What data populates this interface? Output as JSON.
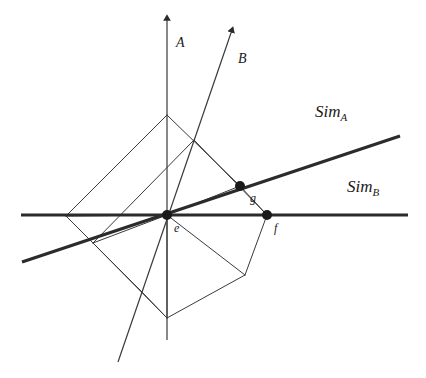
{
  "figure": {
    "type": "geometric-diagram",
    "title": "",
    "background_color": "#ffffff",
    "stroke_color": "#2b2b2b",
    "thin_stroke_width": 1,
    "thick_stroke_width": 3.2,
    "width": 426,
    "height": 378
  },
  "axes": [
    {
      "id": "axis-a",
      "label": "A",
      "label_x": 176,
      "label_y": 36,
      "arrow": true,
      "from": {
        "x": 167,
        "y": 340
      },
      "to": {
        "x": 167,
        "y": 18
      }
    },
    {
      "id": "axis-b",
      "label": "B",
      "label_x": 238,
      "label_y": 52,
      "arrow": true,
      "from": {
        "x": 118,
        "y": 362
      },
      "to": {
        "x": 232,
        "y": 30
      }
    }
  ],
  "sim_lines": [
    {
      "id": "sim-a",
      "label": "Sim",
      "subscript": "A",
      "label_x": 315,
      "label_y": 103,
      "from": {
        "x": 22,
        "y": 262
      },
      "to": {
        "x": 400,
        "y": 136
      }
    },
    {
      "id": "sim-b",
      "label": "Sim",
      "subscript": "B",
      "label_x": 347,
      "label_y": 178,
      "from": {
        "x": 21,
        "y": 215
      },
      "to": {
        "x": 408,
        "y": 215
      }
    }
  ],
  "points": [
    {
      "id": "point-e",
      "label": "e",
      "x": 167,
      "y": 215,
      "label_x": 174,
      "label_y": 222,
      "radius": 5
    },
    {
      "id": "point-g",
      "label": "g",
      "x": 240,
      "y": 186,
      "label_x": 250,
      "label_y": 192,
      "radius": 5
    },
    {
      "id": "point-f",
      "label": "f",
      "x": 267,
      "y": 215,
      "label_x": 274,
      "label_y": 222,
      "radius": 5
    }
  ],
  "lattice": {
    "description": "two overlapping parallelograms forming a lattice around point e",
    "vertices": {
      "left": {
        "x": 66,
        "y": 216
      },
      "top": {
        "x": 167,
        "y": 115
      },
      "center": {
        "x": 167,
        "y": 215
      },
      "bottom": {
        "x": 167,
        "y": 318
      },
      "inner_upper_right": {
        "x": 194,
        "y": 140
      },
      "inner_lower_left": {
        "x": 141,
        "y": 291
      },
      "right_g": {
        "x": 240,
        "y": 186
      },
      "right_f": {
        "x": 267,
        "y": 215
      },
      "lower_left_edge": {
        "x": 93,
        "y": 243
      },
      "lower_right": {
        "x": 245,
        "y": 275
      }
    },
    "edges": [
      {
        "from": [
          66,
          216
        ],
        "to": [
          167,
          115
        ]
      },
      {
        "from": [
          167,
          115
        ],
        "to": [
          240,
          186
        ]
      },
      {
        "from": [
          240,
          186
        ],
        "to": [
          167,
          215
        ]
      },
      {
        "from": [
          167,
          215
        ],
        "to": [
          66,
          216
        ]
      },
      {
        "from": [
          93,
          243
        ],
        "to": [
          194,
          140
        ]
      },
      {
        "from": [
          194,
          140
        ],
        "to": [
          267,
          215
        ]
      },
      {
        "from": [
          267,
          215
        ],
        "to": [
          167,
          215
        ]
      },
      {
        "from": [
          167,
          215
        ],
        "to": [
          93,
          243
        ]
      },
      {
        "from": [
          66,
          216
        ],
        "to": [
          141,
          291
        ]
      },
      {
        "from": [
          141,
          291
        ],
        "to": [
          167,
          318
        ]
      },
      {
        "from": [
          167,
          318
        ],
        "to": [
          167,
          215
        ]
      },
      {
        "from": [
          93,
          243
        ],
        "to": [
          167,
          318
        ]
      },
      {
        "from": [
          167,
          215
        ],
        "to": [
          245,
          275
        ]
      },
      {
        "from": [
          245,
          275
        ],
        "to": [
          267,
          215
        ]
      },
      {
        "from": [
          167,
          318
        ],
        "to": [
          245,
          275
        ]
      },
      {
        "from": [
          240,
          186
        ],
        "to": [
          267,
          215
        ]
      }
    ]
  }
}
